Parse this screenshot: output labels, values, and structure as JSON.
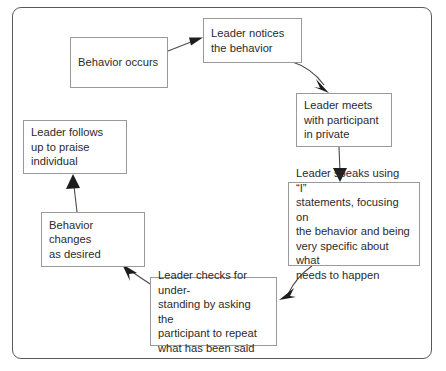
{
  "diagram": {
    "frame": {
      "border_color": "#5a5a5a"
    },
    "node_border_color": "#9a9a9a",
    "text_color": "#2b2b2b",
    "nodes": [
      {
        "id": "behavior-occurs",
        "label": "Behavior occurs"
      },
      {
        "id": "leader-notices",
        "label": "Leader notices\nthe behavior"
      },
      {
        "id": "leader-meets",
        "label": "Leader meets\nwith participant\nin private"
      },
      {
        "id": "leader-speaks",
        "label": "Leader speaks using “I”\nstatements, focusing on\nthe behavior and being\nvery specific about what\nneeds to happen"
      },
      {
        "id": "leader-checks",
        "label": "Leader checks for under-\nstanding by asking the\nparticipant to repeat\nwhat has been said"
      },
      {
        "id": "behavior-changes",
        "label": "Behavior\nchanges\nas desired"
      },
      {
        "id": "leader-follows-up",
        "label": "Leader follows\nup to praise\nindividual"
      }
    ],
    "edges": [
      {
        "id": "edge-occurs-to-notices",
        "from": "behavior-occurs",
        "to": "leader-notices"
      },
      {
        "id": "edge-notices-to-meets",
        "from": "leader-notices",
        "to": "leader-meets"
      },
      {
        "id": "edge-meets-to-speaks",
        "from": "leader-meets",
        "to": "leader-speaks"
      },
      {
        "id": "edge-speaks-to-checks",
        "from": "leader-speaks",
        "to": "leader-checks"
      },
      {
        "id": "edge-checks-to-changes",
        "from": "leader-checks",
        "to": "behavior-changes"
      },
      {
        "id": "edge-changes-to-follows-up",
        "from": "behavior-changes",
        "to": "leader-follows-up"
      }
    ]
  }
}
